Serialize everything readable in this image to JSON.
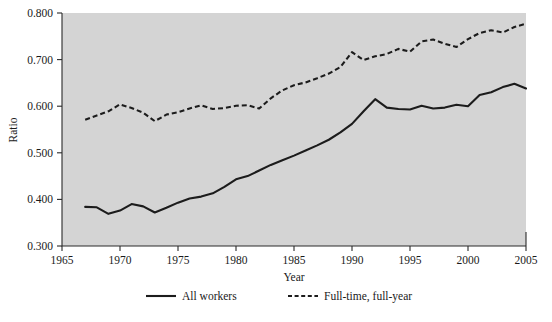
{
  "chart_data": {
    "type": "line",
    "title": "",
    "xlabel": "Year",
    "ylabel": "Ratio",
    "xlim": [
      1965,
      2005
    ],
    "ylim": [
      0.3,
      0.8
    ],
    "xticks": [
      1965,
      1970,
      1975,
      1980,
      1985,
      1990,
      1995,
      2000,
      2005
    ],
    "xtick_labels": [
      "1965",
      "1970",
      "1975",
      "1980",
      "1985",
      "1990",
      "1995",
      "2000",
      "2005"
    ],
    "yticks": [
      0.3,
      0.4,
      0.5,
      0.6,
      0.7,
      0.8
    ],
    "ytick_labels": [
      "0.300",
      "0.400",
      "0.500",
      "0.600",
      "0.700",
      "0.800"
    ],
    "grid": false,
    "legend_position": "bottom",
    "plot_background": "#d4d4d4",
    "line_color": "#1c1c1c",
    "x": [
      1967,
      1968,
      1969,
      1970,
      1971,
      1972,
      1973,
      1974,
      1975,
      1976,
      1977,
      1978,
      1979,
      1980,
      1981,
      1982,
      1983,
      1984,
      1985,
      1986,
      1987,
      1988,
      1989,
      1990,
      1991,
      1992,
      1993,
      1994,
      1995,
      1996,
      1997,
      1998,
      1999,
      2000,
      2001,
      2002,
      2003,
      2004,
      2005
    ],
    "series": [
      {
        "name": "All workers",
        "style": "solid",
        "values": [
          0.384,
          0.383,
          0.369,
          0.376,
          0.39,
          0.385,
          0.372,
          0.382,
          0.393,
          0.402,
          0.406,
          0.413,
          0.427,
          0.443,
          0.45,
          0.462,
          0.474,
          0.484,
          0.494,
          0.505,
          0.516,
          0.528,
          0.544,
          0.562,
          0.589,
          0.615,
          0.597,
          0.594,
          0.593,
          0.601,
          0.595,
          0.597,
          0.603,
          0.6,
          0.624,
          0.63,
          0.641,
          0.648,
          0.638
        ]
      },
      {
        "name": "Full-time, full-year",
        "style": "dashed",
        "values": [
          0.571,
          0.58,
          0.589,
          0.604,
          0.596,
          0.586,
          0.568,
          0.582,
          0.587,
          0.595,
          0.602,
          0.594,
          0.596,
          0.601,
          0.602,
          0.595,
          0.617,
          0.634,
          0.645,
          0.651,
          0.66,
          0.67,
          0.684,
          0.716,
          0.699,
          0.707,
          0.712,
          0.723,
          0.717,
          0.739,
          0.743,
          0.734,
          0.727,
          0.744,
          0.757,
          0.763,
          0.758,
          0.77,
          0.777
        ]
      }
    ]
  },
  "legend": {
    "items": [
      {
        "label": "All workers",
        "style": "solid"
      },
      {
        "label": "Full-time, full-year",
        "style": "dashed"
      }
    ]
  }
}
